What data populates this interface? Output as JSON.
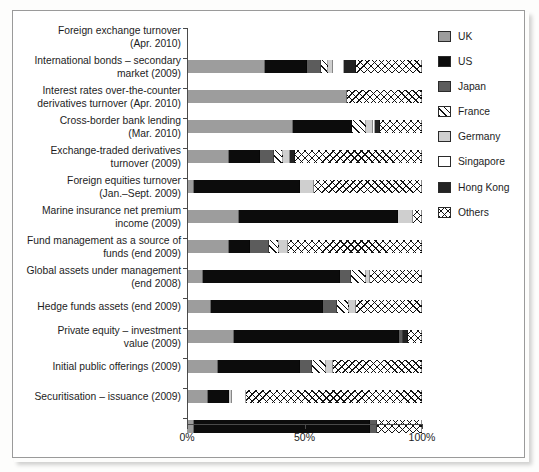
{
  "chart_data": {
    "type": "bar",
    "orientation": "horizontal",
    "stacked": true,
    "title": "",
    "xlabel": "",
    "ylabel": "",
    "xlim": [
      0,
      100
    ],
    "xticks": [
      0,
      50,
      100
    ],
    "xtick_labels": [
      "0%",
      "50%",
      "100%"
    ],
    "grid": false,
    "legend_position": "right",
    "categories": [
      "Foreign exchange turnover (Apr. 2010)",
      "International bonds – secondary market (2009)",
      "Interest rates over-the-counter derivatives turnover (Apr. 2010)",
      "Cross-border bank lending (Mar. 2010)",
      "Exchange-traded derivatives turnover (2009)",
      "Foreign equities turnover (Jan.–Sept. 2009)",
      "Marine insurance net premium income (2009)",
      "Fund management as a source of funds (end 2009)",
      "Global assets under management (end 2008)",
      "Hedge funds assets (end 2009)",
      "Private equity – investment value (2009)",
      "Initial public offerings (2009)",
      "Securitisation – issuance (2009)"
    ],
    "category_lines": [
      [
        "Foreign exchange turnover",
        "(Apr. 2010)"
      ],
      [
        "International bonds – secondary",
        "market (2009)"
      ],
      [
        "Interest rates over-the-counter",
        "derivatives turnover (Apr. 2010)"
      ],
      [
        "Cross-border bank lending",
        "(Mar. 2010)"
      ],
      [
        "Exchange-traded derivatives",
        "turnover (2009)"
      ],
      [
        "Foreign equities turnover",
        "(Jan.–Sept. 2009)"
      ],
      [
        "Marine insurance net premium",
        "income (2009)"
      ],
      [
        "Fund management as a source of",
        "funds (end 2009)"
      ],
      [
        "Global assets under management",
        "(end 2008)"
      ],
      [
        "Hedge funds assets (end 2009)"
      ],
      [
        "Private equity – investment",
        "value (2009)"
      ],
      [
        "Initial public offerings (2009)"
      ],
      [
        "Securitisation – issuance (2009)"
      ]
    ],
    "series": [
      {
        "name": "UK",
        "key": "uk",
        "color": "#9d9d9d",
        "pattern": "solid",
        "values": [
          33.0,
          68.0,
          45.0,
          18.0,
          3.0,
          22.0,
          18.0,
          7.0,
          10.0,
          20.0,
          13.0,
          9.0,
          3.0
        ]
      },
      {
        "name": "US",
        "key": "us",
        "color": "#0c0c0c",
        "pattern": "solid",
        "values": [
          18.0,
          0.0,
          25.0,
          13.0,
          45.0,
          68.0,
          9.0,
          58.0,
          48.0,
          70.0,
          35.0,
          9.0,
          75.0
        ]
      },
      {
        "name": "Japan",
        "key": "jp",
        "color": "#5c5c5c",
        "pattern": "solid",
        "values": [
          6.0,
          0.0,
          0.0,
          6.0,
          0.0,
          0.0,
          8.0,
          5.0,
          6.0,
          2.0,
          5.0,
          0.0,
          3.0
        ]
      },
      {
        "name": "France",
        "key": "fr",
        "color": "#ffffff",
        "pattern": "diagonal-hatch",
        "values": [
          3.0,
          0.0,
          6.0,
          4.0,
          0.0,
          0.0,
          4.0,
          6.0,
          5.0,
          0.0,
          6.0,
          0.0,
          0.0
        ]
      },
      {
        "name": "Germany",
        "key": "de",
        "color": "#cfcfcf",
        "pattern": "solid",
        "values": [
          2.0,
          0.0,
          3.0,
          3.0,
          6.0,
          6.0,
          4.0,
          2.0,
          3.0,
          0.0,
          3.0,
          1.0,
          0.0
        ]
      },
      {
        "name": "Singapore",
        "key": "sg",
        "color": "#ffffff",
        "pattern": "solid",
        "values": [
          5.0,
          0.0,
          1.0,
          0.0,
          0.0,
          0.0,
          0.0,
          0.0,
          0.0,
          0.0,
          0.0,
          6.0,
          0.0
        ]
      },
      {
        "name": "Hong Kong",
        "key": "hk",
        "color": "#232323",
        "pattern": "solid",
        "values": [
          5.0,
          0.0,
          2.0,
          2.0,
          0.0,
          0.0,
          0.0,
          0.0,
          0.0,
          2.0,
          0.0,
          0.0,
          0.0
        ]
      },
      {
        "name": "Others",
        "key": "ot",
        "color": "#ffffff",
        "pattern": "cross-hatch",
        "values": [
          28.0,
          32.0,
          18.0,
          54.0,
          46.0,
          4.0,
          57.0,
          22.0,
          28.0,
          6.0,
          38.0,
          75.0,
          19.0
        ]
      }
    ]
  },
  "legend": {
    "items": [
      {
        "label": "UK",
        "swatch": "uk-swatch-icon"
      },
      {
        "label": "US",
        "swatch": "us-swatch-icon"
      },
      {
        "label": "Japan",
        "swatch": "japan-swatch-icon"
      },
      {
        "label": "France",
        "swatch": "france-swatch-icon"
      },
      {
        "label": "Germany",
        "swatch": "germany-swatch-icon"
      },
      {
        "label": "Singapore",
        "swatch": "singapore-swatch-icon"
      },
      {
        "label": "Hong Kong",
        "swatch": "hongkong-swatch-icon"
      },
      {
        "label": "Others",
        "swatch": "others-swatch-icon"
      }
    ]
  },
  "axis": {
    "x_tick_labels": [
      "0%",
      "50%",
      "100%"
    ]
  }
}
